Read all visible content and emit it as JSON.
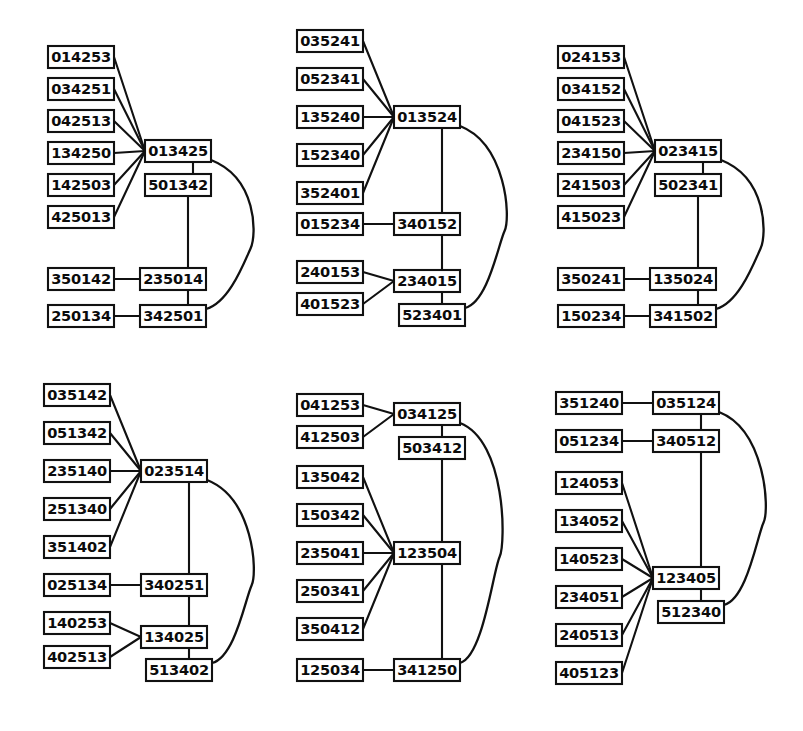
{
  "figure": {
    "panel_count": 6,
    "box_width": 66,
    "box_height": 22,
    "stroke_color": "#111111",
    "box_fill": "#ffffff",
    "label_color": "#0b0b0b"
  },
  "panels": [
    {
      "id": "panel-top-left",
      "origin": [
        18,
        8
      ],
      "hub": "013425",
      "nodes": [
        {
          "id": "p1n1",
          "label": "014253",
          "x": 30,
          "y": 38
        },
        {
          "id": "p1n2",
          "label": "034251",
          "x": 30,
          "y": 70
        },
        {
          "id": "p1n3",
          "label": "042513",
          "x": 30,
          "y": 102
        },
        {
          "id": "p1n4",
          "label": "134250",
          "x": 30,
          "y": 134
        },
        {
          "id": "p1n5",
          "label": "142503",
          "x": 30,
          "y": 166
        },
        {
          "id": "p1n6",
          "label": "425013",
          "x": 30,
          "y": 198
        },
        {
          "id": "p1n7",
          "label": "350142",
          "x": 30,
          "y": 260
        },
        {
          "id": "p1n8",
          "label": "250134",
          "x": 30,
          "y": 297
        },
        {
          "id": "p1hub",
          "label": "013425",
          "x": 127,
          "y": 132
        },
        {
          "id": "p1n9",
          "label": "501342",
          "x": 127,
          "y": 166
        },
        {
          "id": "p1n10",
          "label": "235014",
          "x": 122,
          "y": 260
        },
        {
          "id": "p1n11",
          "label": "342501",
          "x": 122,
          "y": 297
        }
      ],
      "edges": [
        {
          "from": "p1n1",
          "to": "p1hub",
          "type": "line"
        },
        {
          "from": "p1n2",
          "to": "p1hub",
          "type": "line"
        },
        {
          "from": "p1n3",
          "to": "p1hub",
          "type": "line"
        },
        {
          "from": "p1n4",
          "to": "p1hub",
          "type": "line"
        },
        {
          "from": "p1n5",
          "to": "p1hub",
          "type": "line"
        },
        {
          "from": "p1n6",
          "to": "p1hub",
          "type": "line"
        },
        {
          "from": "p1n7",
          "to": "p1n10",
          "type": "line"
        },
        {
          "from": "p1n8",
          "to": "p1n11",
          "type": "line"
        },
        {
          "from": "p1hub",
          "to": "p1n9",
          "type": "vertical"
        },
        {
          "from": "p1n9",
          "to": "p1n10",
          "type": "vertical"
        },
        {
          "from": "p1n10",
          "to": "p1n11",
          "type": "vertical"
        },
        {
          "from": "p1hub",
          "to": "p1n11",
          "type": "arc"
        }
      ]
    },
    {
      "id": "panel-top-middle",
      "origin": [
        275,
        8
      ],
      "hub": "013524",
      "nodes": [
        {
          "id": "p2n1",
          "label": "035241",
          "x": 22,
          "y": 22
        },
        {
          "id": "p2n2",
          "label": "052341",
          "x": 22,
          "y": 60
        },
        {
          "id": "p2n3",
          "label": "135240",
          "x": 22,
          "y": 98
        },
        {
          "id": "p2n4",
          "label": "152340",
          "x": 22,
          "y": 136
        },
        {
          "id": "p2n5",
          "label": "352401",
          "x": 22,
          "y": 174
        },
        {
          "id": "p2n6",
          "label": "015234",
          "x": 22,
          "y": 205
        },
        {
          "id": "p2n7",
          "label": "240153",
          "x": 22,
          "y": 253
        },
        {
          "id": "p2n8",
          "label": "401523",
          "x": 22,
          "y": 285
        },
        {
          "id": "p2hub",
          "label": "013524",
          "x": 119,
          "y": 98
        },
        {
          "id": "p2n9",
          "label": "340152",
          "x": 119,
          "y": 205
        },
        {
          "id": "p2n10",
          "label": "234015",
          "x": 119,
          "y": 262
        },
        {
          "id": "p2n11",
          "label": "523401",
          "x": 124,
          "y": 296
        }
      ],
      "edges": [
        {
          "from": "p2n1",
          "to": "p2hub",
          "type": "line"
        },
        {
          "from": "p2n2",
          "to": "p2hub",
          "type": "line"
        },
        {
          "from": "p2n3",
          "to": "p2hub",
          "type": "line"
        },
        {
          "from": "p2n4",
          "to": "p2hub",
          "type": "line"
        },
        {
          "from": "p2n5",
          "to": "p2hub",
          "type": "line"
        },
        {
          "from": "p2n6",
          "to": "p2n9",
          "type": "line"
        },
        {
          "from": "p2n7",
          "to": "p2n10",
          "type": "line"
        },
        {
          "from": "p2n8",
          "to": "p2n10",
          "type": "line"
        },
        {
          "from": "p2hub",
          "to": "p2n9",
          "type": "vertical"
        },
        {
          "from": "p2n9",
          "to": "p2n10",
          "type": "vertical"
        },
        {
          "from": "p2n10",
          "to": "p2n11",
          "type": "vertical"
        },
        {
          "from": "p2hub",
          "to": "p2n11",
          "type": "arc"
        }
      ]
    },
    {
      "id": "panel-top-right",
      "origin": [
        530,
        8
      ],
      "hub": "023415",
      "nodes": [
        {
          "id": "p3n1",
          "label": "024153",
          "x": 28,
          "y": 38
        },
        {
          "id": "p3n2",
          "label": "034152",
          "x": 28,
          "y": 70
        },
        {
          "id": "p3n3",
          "label": "041523",
          "x": 28,
          "y": 102
        },
        {
          "id": "p3n4",
          "label": "234150",
          "x": 28,
          "y": 134
        },
        {
          "id": "p3n5",
          "label": "241503",
          "x": 28,
          "y": 166
        },
        {
          "id": "p3n6",
          "label": "415023",
          "x": 28,
          "y": 198
        },
        {
          "id": "p3n7",
          "label": "350241",
          "x": 28,
          "y": 260
        },
        {
          "id": "p3n8",
          "label": "150234",
          "x": 28,
          "y": 297
        },
        {
          "id": "p3hub",
          "label": "023415",
          "x": 125,
          "y": 132
        },
        {
          "id": "p3n9",
          "label": "502341",
          "x": 125,
          "y": 166
        },
        {
          "id": "p3n10",
          "label": "135024",
          "x": 120,
          "y": 260
        },
        {
          "id": "p3n11",
          "label": "341502",
          "x": 120,
          "y": 297
        }
      ],
      "edges": [
        {
          "from": "p3n1",
          "to": "p3hub",
          "type": "line"
        },
        {
          "from": "p3n2",
          "to": "p3hub",
          "type": "line"
        },
        {
          "from": "p3n3",
          "to": "p3hub",
          "type": "line"
        },
        {
          "from": "p3n4",
          "to": "p3hub",
          "type": "line"
        },
        {
          "from": "p3n5",
          "to": "p3hub",
          "type": "line"
        },
        {
          "from": "p3n6",
          "to": "p3hub",
          "type": "line"
        },
        {
          "from": "p3n7",
          "to": "p3n10",
          "type": "line"
        },
        {
          "from": "p3n8",
          "to": "p3n11",
          "type": "line"
        },
        {
          "from": "p3hub",
          "to": "p3n9",
          "type": "vertical"
        },
        {
          "from": "p3n9",
          "to": "p3n10",
          "type": "vertical"
        },
        {
          "from": "p3n10",
          "to": "p3n11",
          "type": "vertical"
        },
        {
          "from": "p3hub",
          "to": "p3n11",
          "type": "arc"
        }
      ]
    },
    {
      "id": "panel-bottom-left",
      "origin": [
        18,
        368
      ],
      "hub": "023514",
      "nodes": [
        {
          "id": "p4n1",
          "label": "035142",
          "x": 26,
          "y": 16
        },
        {
          "id": "p4n2",
          "label": "051342",
          "x": 26,
          "y": 54
        },
        {
          "id": "p4n3",
          "label": "235140",
          "x": 26,
          "y": 92
        },
        {
          "id": "p4n4",
          "label": "251340",
          "x": 26,
          "y": 130
        },
        {
          "id": "p4n5",
          "label": "351402",
          "x": 26,
          "y": 168
        },
        {
          "id": "p4n6",
          "label": "025134",
          "x": 26,
          "y": 206
        },
        {
          "id": "p4n7",
          "label": "140253",
          "x": 26,
          "y": 244
        },
        {
          "id": "p4n8",
          "label": "402513",
          "x": 26,
          "y": 278
        },
        {
          "id": "p4hub",
          "label": "023514",
          "x": 123,
          "y": 92
        },
        {
          "id": "p4n9",
          "label": "340251",
          "x": 123,
          "y": 206
        },
        {
          "id": "p4n10",
          "label": "134025",
          "x": 123,
          "y": 258
        },
        {
          "id": "p4n11",
          "label": "513402",
          "x": 128,
          "y": 291
        }
      ],
      "edges": [
        {
          "from": "p4n1",
          "to": "p4hub",
          "type": "line"
        },
        {
          "from": "p4n2",
          "to": "p4hub",
          "type": "line"
        },
        {
          "from": "p4n3",
          "to": "p4hub",
          "type": "line"
        },
        {
          "from": "p4n4",
          "to": "p4hub",
          "type": "line"
        },
        {
          "from": "p4n5",
          "to": "p4hub",
          "type": "line"
        },
        {
          "from": "p4n6",
          "to": "p4n9",
          "type": "line"
        },
        {
          "from": "p4n7",
          "to": "p4n10",
          "type": "line"
        },
        {
          "from": "p4n8",
          "to": "p4n10",
          "type": "line"
        },
        {
          "from": "p4hub",
          "to": "p4n9",
          "type": "vertical"
        },
        {
          "from": "p4n9",
          "to": "p4n10",
          "type": "vertical"
        },
        {
          "from": "p4n10",
          "to": "p4n11",
          "type": "vertical"
        },
        {
          "from": "p4hub",
          "to": "p4n11",
          "type": "arc"
        }
      ]
    },
    {
      "id": "panel-bottom-middle",
      "origin": [
        275,
        368
      ],
      "hub": "123504",
      "nodes": [
        {
          "id": "p5n1",
          "label": "041253",
          "x": 22,
          "y": 26
        },
        {
          "id": "p5n2",
          "label": "412503",
          "x": 22,
          "y": 58
        },
        {
          "id": "p5n3",
          "label": "135042",
          "x": 22,
          "y": 98
        },
        {
          "id": "p5n4",
          "label": "150342",
          "x": 22,
          "y": 136
        },
        {
          "id": "p5n5",
          "label": "235041",
          "x": 22,
          "y": 174
        },
        {
          "id": "p5n6",
          "label": "250341",
          "x": 22,
          "y": 212
        },
        {
          "id": "p5n7",
          "label": "350412",
          "x": 22,
          "y": 250
        },
        {
          "id": "p5n8",
          "label": "125034",
          "x": 22,
          "y": 291
        },
        {
          "id": "p5n9",
          "label": "034125",
          "x": 119,
          "y": 35
        },
        {
          "id": "p5n10",
          "label": "503412",
          "x": 124,
          "y": 69
        },
        {
          "id": "p5hub",
          "label": "123504",
          "x": 119,
          "y": 174
        },
        {
          "id": "p5n11",
          "label": "341250",
          "x": 119,
          "y": 291
        }
      ],
      "edges": [
        {
          "from": "p5n1",
          "to": "p5n9",
          "type": "line"
        },
        {
          "from": "p5n2",
          "to": "p5n9",
          "type": "line"
        },
        {
          "from": "p5n3",
          "to": "p5hub",
          "type": "line"
        },
        {
          "from": "p5n4",
          "to": "p5hub",
          "type": "line"
        },
        {
          "from": "p5n5",
          "to": "p5hub",
          "type": "line"
        },
        {
          "from": "p5n6",
          "to": "p5hub",
          "type": "line"
        },
        {
          "from": "p5n7",
          "to": "p5hub",
          "type": "line"
        },
        {
          "from": "p5n8",
          "to": "p5n11",
          "type": "line"
        },
        {
          "from": "p5n9",
          "to": "p5n10",
          "type": "vertical"
        },
        {
          "from": "p5n10",
          "to": "p5hub",
          "type": "vertical"
        },
        {
          "from": "p5hub",
          "to": "p5n11",
          "type": "vertical"
        },
        {
          "from": "p5n9",
          "to": "p5n11",
          "type": "arc"
        }
      ]
    },
    {
      "id": "panel-bottom-right",
      "origin": [
        530,
        368
      ],
      "hub": "123405",
      "nodes": [
        {
          "id": "p6n1",
          "label": "351240",
          "x": 26,
          "y": 24
        },
        {
          "id": "p6n2",
          "label": "051234",
          "x": 26,
          "y": 62
        },
        {
          "id": "p6n3",
          "label": "124053",
          "x": 26,
          "y": 104
        },
        {
          "id": "p6n4",
          "label": "134052",
          "x": 26,
          "y": 142
        },
        {
          "id": "p6n5",
          "label": "140523",
          "x": 26,
          "y": 180
        },
        {
          "id": "p6n6",
          "label": "234051",
          "x": 26,
          "y": 218
        },
        {
          "id": "p6n7",
          "label": "240513",
          "x": 26,
          "y": 256
        },
        {
          "id": "p6n8",
          "label": "405123",
          "x": 26,
          "y": 294
        },
        {
          "id": "p6n9",
          "label": "035124",
          "x": 123,
          "y": 24
        },
        {
          "id": "p6n10",
          "label": "340512",
          "x": 123,
          "y": 62
        },
        {
          "id": "p6hub",
          "label": "123405",
          "x": 123,
          "y": 199
        },
        {
          "id": "p6n11",
          "label": "512340",
          "x": 128,
          "y": 233
        }
      ],
      "edges": [
        {
          "from": "p6n1",
          "to": "p6n9",
          "type": "line"
        },
        {
          "from": "p6n2",
          "to": "p6n10",
          "type": "line"
        },
        {
          "from": "p6n3",
          "to": "p6hub",
          "type": "line"
        },
        {
          "from": "p6n4",
          "to": "p6hub",
          "type": "line"
        },
        {
          "from": "p6n5",
          "to": "p6hub",
          "type": "line"
        },
        {
          "from": "p6n6",
          "to": "p6hub",
          "type": "line"
        },
        {
          "from": "p6n7",
          "to": "p6hub",
          "type": "line"
        },
        {
          "from": "p6n8",
          "to": "p6hub",
          "type": "line"
        },
        {
          "from": "p6n9",
          "to": "p6n10",
          "type": "vertical"
        },
        {
          "from": "p6n10",
          "to": "p6hub",
          "type": "vertical"
        },
        {
          "from": "p6hub",
          "to": "p6n11",
          "type": "vertical"
        },
        {
          "from": "p6n9",
          "to": "p6n11",
          "type": "arc"
        }
      ]
    }
  ]
}
